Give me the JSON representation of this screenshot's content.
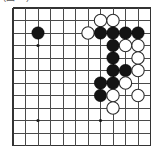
{
  "caption": {
    "text": "(図11)"
  },
  "board": {
    "name": "go-board",
    "columns": 12,
    "rows": 12,
    "origin": {
      "x": 13,
      "y": 8
    },
    "spacing": 12.5,
    "line_color": "#4a4a4a",
    "edge_color": "#333333",
    "background_color": "#ffffff",
    "stone_radius": 6.2,
    "hoshi_radius": 1.6,
    "hoshi_points": [
      {
        "col": 3,
        "row": 4,
        "label": "star-point-upper-left"
      },
      {
        "col": 3,
        "row": 10,
        "label": "star-point-lower-left"
      },
      {
        "col": 8,
        "row": 10,
        "label": "star-point-lower-right"
      }
    ],
    "stones": [
      {
        "col": 3,
        "row": 3,
        "color": "black",
        "id": "b1"
      },
      {
        "col": 8,
        "row": 2,
        "color": "white",
        "id": "w1"
      },
      {
        "col": 9,
        "row": 2,
        "color": "white",
        "id": "w2"
      },
      {
        "col": 7,
        "row": 3,
        "color": "white",
        "id": "w3"
      },
      {
        "col": 8,
        "row": 3,
        "color": "black",
        "id": "b2"
      },
      {
        "col": 9,
        "row": 3,
        "color": "black",
        "id": "b3"
      },
      {
        "col": 10,
        "row": 3,
        "color": "black",
        "id": "b4"
      },
      {
        "col": 11,
        "row": 3,
        "color": "black",
        "id": "b5"
      },
      {
        "col": 9,
        "row": 4,
        "color": "black",
        "id": "b6"
      },
      {
        "col": 10,
        "row": 4,
        "color": "white",
        "id": "w4"
      },
      {
        "col": 11,
        "row": 4,
        "color": "white",
        "id": "w5"
      },
      {
        "col": 9,
        "row": 5,
        "color": "black",
        "id": "b7"
      },
      {
        "col": 11,
        "row": 5,
        "color": "white",
        "id": "w6"
      },
      {
        "col": 9,
        "row": 6,
        "color": "black",
        "id": "b8"
      },
      {
        "col": 10,
        "row": 6,
        "color": "black",
        "id": "b9"
      },
      {
        "col": 11,
        "row": 6,
        "color": "white",
        "id": "w7"
      },
      {
        "col": 8,
        "row": 7,
        "color": "black",
        "id": "b10"
      },
      {
        "col": 9,
        "row": 7,
        "color": "black",
        "id": "b11"
      },
      {
        "col": 10,
        "row": 7,
        "color": "white",
        "id": "w8"
      },
      {
        "col": 8,
        "row": 8,
        "color": "black",
        "id": "b12"
      },
      {
        "col": 9,
        "row": 8,
        "color": "white",
        "id": "w9"
      },
      {
        "col": 11,
        "row": 8,
        "color": "white",
        "id": "w10"
      },
      {
        "col": 9,
        "row": 9,
        "color": "white",
        "id": "w11"
      }
    ]
  }
}
